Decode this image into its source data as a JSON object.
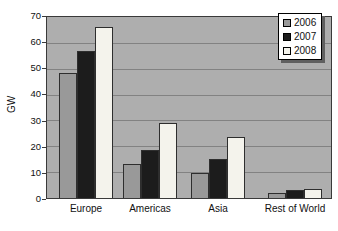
{
  "chart_data": {
    "type": "bar",
    "title": "",
    "xlabel": "",
    "ylabel": "GW",
    "ylim": [
      0,
      70
    ],
    "ytick_step": 10,
    "yticks": [
      0,
      10,
      20,
      30,
      40,
      50,
      60,
      70
    ],
    "categories": [
      "Europe",
      "Americas",
      "Asia",
      "Rest of World"
    ],
    "series": [
      {
        "name": "2006",
        "color": "#999999",
        "values": [
          48.5,
          13,
          9.5,
          2
        ]
      },
      {
        "name": "2007",
        "color": "#1c1c1c",
        "values": [
          57,
          18.5,
          15,
          3
        ]
      },
      {
        "name": "2008",
        "color": "#f4f3ec",
        "values": [
          66,
          29,
          23.5,
          3.5
        ]
      }
    ],
    "legend_position": "top-right",
    "grid": true,
    "colors": {
      "outer_background": "#ffffff",
      "plot_background": "#aeaeae",
      "gridline": "#828282",
      "plot_border": "#3a3a3a",
      "bar_border": "#2e2e2e",
      "legend_background": "#ffffff",
      "legend_border": "#000000",
      "legend_shadow": "#5f5f5f",
      "text": "#111111"
    }
  }
}
